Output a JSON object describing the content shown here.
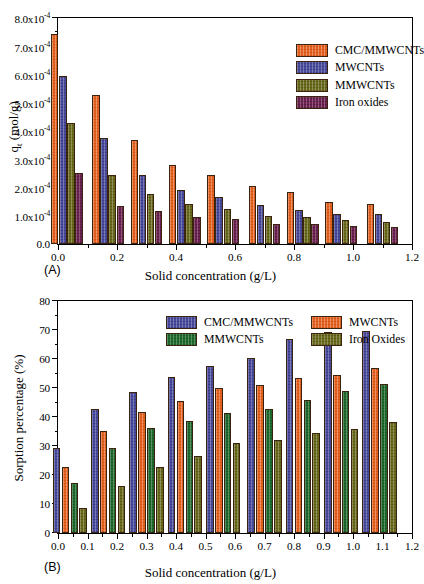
{
  "figure": {
    "panels": [
      {
        "tag": "(A)",
        "xlabel": "Solid concentration (g/L)",
        "ylabel_main": "q",
        "ylabel_sub": "t",
        "ylabel_unit": " (mol/g)"
      },
      {
        "tag": "(B)",
        "xlabel": "Solid concentration (g/L)",
        "ylabel": "Sorption percentage (%)"
      }
    ]
  },
  "colors": {
    "orange": "#e8621f",
    "blue": "#4a4d9e",
    "olive": "#6b6b1e",
    "maroon": "#6e2352",
    "green": "#1f6b2e",
    "axis": "#000000",
    "background": "#ffffff"
  },
  "chart_data": [
    {
      "type": "bar",
      "panel": "A",
      "title": "",
      "xlabel": "Solid concentration (g/L)",
      "ylabel": "q_t (mol/g)",
      "grid": false,
      "legend_position": "top-right",
      "legend_layout": "vertical",
      "xlim": [
        0.0,
        1.2
      ],
      "ylim": [
        0.0,
        0.0008
      ],
      "xticks": [
        "0.0",
        "0.2",
        "0.4",
        "0.6",
        "0.8",
        "1.0",
        "1.2"
      ],
      "xtick_values": [
        0.0,
        0.2,
        0.4,
        0.6,
        0.8,
        1.0,
        1.2
      ],
      "yticks": [
        "0.0",
        "1.0x10-4",
        "2.0x10-4",
        "3.0x10-4",
        "4.0x10-4",
        "5.0x10-4",
        "6.0x10-4",
        "7.0x10-4",
        "8.0x10-4"
      ],
      "ytick_values": [
        0.0,
        0.0001,
        0.0002,
        0.0003,
        0.0004,
        0.0005,
        0.0006,
        0.0007,
        0.0008
      ],
      "ytick_mantissa": [
        "0.0",
        "1.0x10",
        "2.0x10",
        "3.0x10",
        "4.0x10",
        "5.0x10",
        "6.0x10",
        "7.0x10",
        "8.0x10"
      ],
      "ytick_exponent": "-4",
      "categories": [
        0.03,
        0.17,
        0.3,
        0.43,
        0.56,
        0.7,
        0.83,
        0.96,
        1.1
      ],
      "category_labels": [
        "0.03",
        "0.17",
        "0.30",
        "0.43",
        "0.56",
        "0.70",
        "0.83",
        "0.96",
        "1.10"
      ],
      "series": [
        {
          "name": "CMC/MMWCNTs",
          "color": "#e8621f",
          "texture": "tex-orange",
          "values": [
            0.000745,
            0.000528,
            0.000369,
            0.000281,
            0.000243,
            0.000206,
            0.000185,
            0.00015,
            0.00014
          ]
        },
        {
          "name": "MWCNTs",
          "color": "#4a4d9e",
          "texture": "tex-blue",
          "values": [
            0.000593,
            0.000375,
            0.000243,
            0.000191,
            0.000166,
            0.000138,
            0.000121,
            0.000106,
            0.000105
          ]
        },
        {
          "name": "MMWCNTs",
          "color": "#6b6b1e",
          "texture": "tex-olive",
          "values": [
            0.000427,
            0.000243,
            0.000178,
            0.000143,
            0.000124,
            9.9e-05,
            9.7e-05,
            8.5e-05,
            7.7e-05
          ]
        },
        {
          "name": "Iron oxides",
          "color": "#6e2352",
          "texture": "tex-maroon",
          "values": [
            0.00025,
            0.000134,
            0.000116,
            9.5e-05,
            8.9e-05,
            7.1e-05,
            7e-05,
            6.4e-05,
            5.9e-05
          ]
        }
      ]
    },
    {
      "type": "bar",
      "panel": "B",
      "title": "",
      "xlabel": "Solid concentration (g/L)",
      "ylabel": "Sorption percentage (%)",
      "grid": false,
      "legend_position": "top-left",
      "legend_layout": "2x2",
      "xlim": [
        0.0,
        1.2
      ],
      "ylim": [
        0,
        80
      ],
      "xticks": [
        "0.0",
        "0.1",
        "0.2",
        "0.3",
        "0.4",
        "0.5",
        "0.6",
        "0.7",
        "0.8",
        "0.9",
        "1.0",
        "1.1",
        "1.2"
      ],
      "xtick_values": [
        0.0,
        0.1,
        0.2,
        0.3,
        0.4,
        0.5,
        0.6,
        0.7,
        0.8,
        0.9,
        1.0,
        1.1,
        1.2
      ],
      "yticks": [
        "0",
        "10",
        "20",
        "30",
        "40",
        "50",
        "60",
        "70",
        "80"
      ],
      "ytick_values": [
        0,
        10,
        20,
        30,
        40,
        50,
        60,
        70,
        80
      ],
      "categories": [
        0.04,
        0.17,
        0.3,
        0.43,
        0.56,
        0.7,
        0.83,
        0.96,
        1.09
      ],
      "category_labels": [
        "0.04",
        "0.17",
        "0.30",
        "0.43",
        "0.56",
        "0.70",
        "0.83",
        "0.96",
        "1.09"
      ],
      "series": [
        {
          "name": "CMC/MMWCNTs",
          "color": "#4a4d9e",
          "texture": "tex-blue",
          "values": [
            29.3,
            42.8,
            48.5,
            53.9,
            57.5,
            60.4,
            67.0,
            69.3,
            69.6
          ]
        },
        {
          "name": "MWCNTs",
          "color": "#e8621f",
          "texture": "tex-orange",
          "values": [
            22.6,
            35.2,
            41.8,
            45.4,
            49.9,
            51.2,
            53.3,
            54.5,
            56.8
          ]
        },
        {
          "name": "MMWCNTs",
          "color": "#1f6b2e",
          "texture": "tex-green",
          "values": [
            17.1,
            29.4,
            36.3,
            38.7,
            41.3,
            42.6,
            45.9,
            49.1,
            51.4
          ]
        },
        {
          "name": "Iron Oxides",
          "color": "#6b6b1e",
          "texture": "tex-olive",
          "values": [
            8.5,
            16.2,
            22.9,
            26.5,
            30.9,
            32.2,
            34.5,
            35.9,
            38.2
          ]
        }
      ]
    }
  ]
}
